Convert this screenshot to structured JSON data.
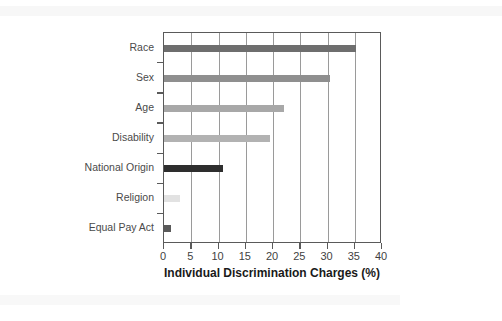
{
  "chart_data": {
    "type": "bar",
    "orientation": "horizontal",
    "title": "",
    "xlabel": "Individual Discrimination Charges (%)",
    "ylabel": "",
    "xlim": [
      0,
      40
    ],
    "grid": true,
    "legend": "none",
    "categories": [
      "Race",
      "Sex",
      "Age",
      "Disability",
      "National Origin",
      "Religion",
      "Equal Pay Act"
    ],
    "values": [
      35.3,
      30.4,
      22.0,
      19.5,
      10.8,
      3.0,
      1.3
    ],
    "bar_colors": [
      "#6e6e6e",
      "#8f8f8f",
      "#a8a8a8",
      "#b2b2b2",
      "#2e2e2e",
      "#e2e2e2",
      "#5a5a5a"
    ],
    "x_ticks": [
      0,
      5,
      10,
      15,
      20,
      25,
      30,
      35,
      40
    ],
    "x_tick_labels": [
      "0",
      "5",
      "10",
      "15",
      "20",
      "25",
      "30",
      "35",
      "40"
    ],
    "axis_color": "#5a5a5a",
    "gridline_color": "#9a9a9a",
    "label_color": "#4a4a4a",
    "background": "#ffffff"
  }
}
